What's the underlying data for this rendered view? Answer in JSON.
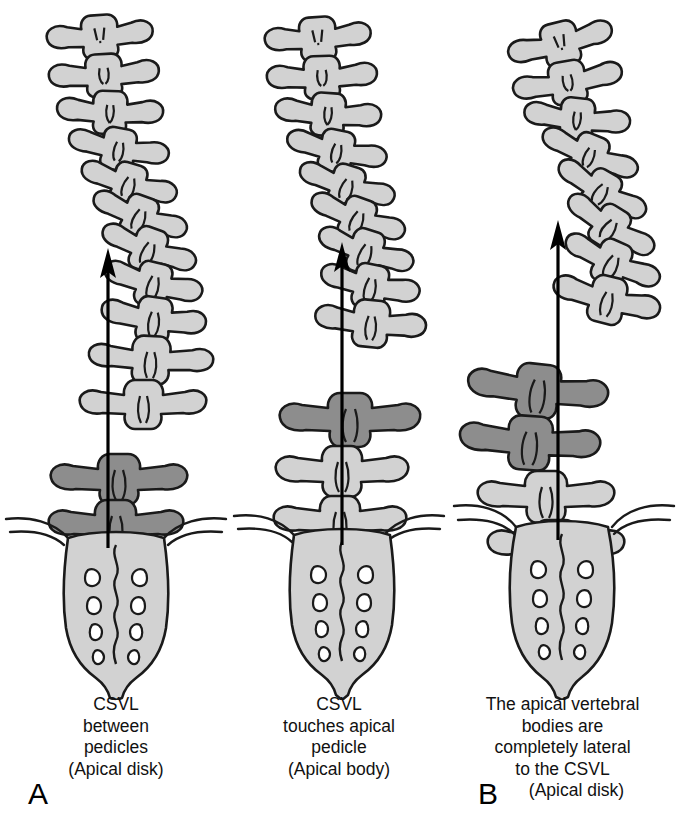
{
  "figure": {
    "type": "medical-illustration",
    "view": "posteroanterior coronal",
    "colors": {
      "background": "#ffffff",
      "bone_light": "#d2d2d2",
      "bone_dark": "#8d8d8d",
      "outline": "#1a1a1a",
      "csvl_line": "#000000",
      "text": "#111111"
    }
  },
  "panels": [
    {
      "id": "A",
      "letter": "A",
      "caption_lines": [
        "CSVL",
        "between",
        "pedicles",
        "(Apical disk)"
      ],
      "apex_relation": "CSVL passes between the pedicles of the apical vertebrae",
      "apical_level": "lower lumbar",
      "shaded_vertebrae_count": 2,
      "csvl_label": "CSVL",
      "arrow_label": "csvl-arrow"
    },
    {
      "id": "B",
      "letter": "B",
      "caption_lines": [
        "CSVL",
        "touches apical",
        "pedicle",
        "(Apical body)"
      ],
      "apex_relation": "CSVL touches the apical pedicle",
      "apical_level": "mid lumbar",
      "shaded_vertebrae_count": 1,
      "csvl_label": "CSVL",
      "arrow_label": "csvl-arrow"
    },
    {
      "id": "C",
      "letter": "C",
      "caption_lines": [
        "The apical vertebral",
        "bodies are",
        "completely lateral",
        "to the CSVL"
      ],
      "caption_last_line": "(Apical disk)",
      "apex_relation": "Apical vertebral bodies lie completely lateral to the CSVL",
      "apical_level": "upper lumbar",
      "shaded_vertebrae_count": 2,
      "csvl_label": "CSVL",
      "arrow_label": "csvl-arrow"
    }
  ]
}
